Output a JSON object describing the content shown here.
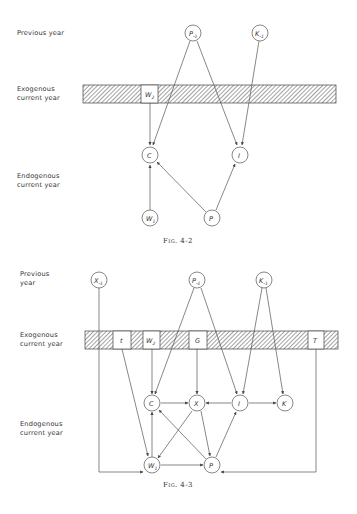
{
  "figures": [
    {
      "id": "fig-4-2",
      "caption": "Fig. 4-2",
      "row_labels": {
        "previous": "Previous year",
        "exogenous": "Exogenous\ncurrent year",
        "endogenous": "Endogenous\ncurrent year"
      },
      "nodes": {
        "P_prev": {
          "main": "P",
          "sub": "-1"
        },
        "K_prev": {
          "main": "K",
          "sub": "-1"
        },
        "W2": {
          "main": "W",
          "sub": "2"
        },
        "C": {
          "main": "C",
          "sub": ""
        },
        "I": {
          "main": "I",
          "sub": ""
        },
        "W1": {
          "main": "W",
          "sub": "1"
        },
        "P": {
          "main": "P",
          "sub": ""
        }
      },
      "edges": [
        [
          "P_prev",
          "C"
        ],
        [
          "P_prev",
          "I"
        ],
        [
          "K_prev",
          "I"
        ],
        [
          "W2",
          "C"
        ],
        [
          "W1",
          "C"
        ],
        [
          "P",
          "C"
        ],
        [
          "P",
          "I"
        ]
      ]
    },
    {
      "id": "fig-4-3",
      "caption": "Fig. 4-3",
      "row_labels": {
        "previous": "Previous\nyear",
        "exogenous": "Exogenous\ncurrent year",
        "endogenous": "Endogenous\ncurrent year"
      },
      "nodes": {
        "X_prev": {
          "main": "X",
          "sub": "-1"
        },
        "P_prev": {
          "main": "P",
          "sub": "-1"
        },
        "K_prev": {
          "main": "K",
          "sub": "-1"
        },
        "t": {
          "main": "t",
          "sub": ""
        },
        "W2": {
          "main": "W",
          "sub": "2"
        },
        "G": {
          "main": "G",
          "sub": ""
        },
        "T": {
          "main": "T",
          "sub": ""
        },
        "C": {
          "main": "C",
          "sub": ""
        },
        "X": {
          "main": "X",
          "sub": ""
        },
        "I": {
          "main": "I",
          "sub": ""
        },
        "K": {
          "main": "K",
          "sub": ""
        },
        "W1": {
          "main": "W",
          "sub": "1"
        },
        "P": {
          "main": "P",
          "sub": ""
        }
      },
      "edges": [
        [
          "X_prev",
          "W1"
        ],
        [
          "P_prev",
          "C"
        ],
        [
          "P_prev",
          "I"
        ],
        [
          "K_prev",
          "I"
        ],
        [
          "K_prev",
          "K"
        ],
        [
          "t",
          "W1"
        ],
        [
          "W2",
          "C"
        ],
        [
          "G",
          "X"
        ],
        [
          "T",
          "P"
        ],
        [
          "C",
          "X"
        ],
        [
          "I",
          "X"
        ],
        [
          "I",
          "K"
        ],
        [
          "W1",
          "C"
        ],
        [
          "X",
          "W1"
        ],
        [
          "X",
          "P"
        ],
        [
          "P",
          "C"
        ],
        [
          "P",
          "I"
        ],
        [
          "W1",
          "P"
        ]
      ]
    }
  ]
}
